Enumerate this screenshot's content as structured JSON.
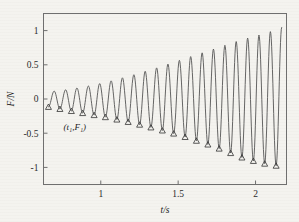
{
  "chart_data": {
    "type": "line",
    "title": "",
    "xlabel": "t/s",
    "ylabel": "F/N",
    "xlim": [
      0.63,
      2.2
    ],
    "ylim": [
      -1.25,
      1.25
    ],
    "xticks": [
      1,
      1.5,
      2
    ],
    "xtick_labels": [
      "1",
      "1.5",
      "2"
    ],
    "yticks": [
      1,
      0.5,
      0,
      -0.5,
      -1
    ],
    "ytick_labels": [
      "1",
      "0.5",
      "0",
      "-0.5",
      "-1"
    ],
    "grid": false,
    "legend": null,
    "annotations": [
      {
        "text": "(t₁,F₁)",
        "x": 0.76,
        "y": -0.45
      }
    ],
    "series": [
      {
        "name": "force-oscillation",
        "description": "damped-inverse growing sinusoid, amplitude increases with time",
        "marker": "triangle-at-troughs",
        "period": 0.0735,
        "x_start": 0.655,
        "x_end": 2.185
      }
    ],
    "trough_points": {
      "x": [
        0.662,
        0.736,
        0.81,
        0.883,
        0.957,
        1.03,
        1.104,
        1.177,
        1.251,
        1.324,
        1.398,
        1.471,
        1.545,
        1.618,
        1.692,
        1.765,
        1.839,
        1.912,
        1.986,
        2.059,
        2.133
      ],
      "y": [
        -0.115,
        -0.145,
        -0.175,
        -0.205,
        -0.235,
        -0.265,
        -0.3,
        -0.335,
        -0.375,
        -0.415,
        -0.46,
        -0.505,
        -0.555,
        -0.61,
        -0.665,
        -0.725,
        -0.79,
        -0.855,
        -0.905,
        -0.945,
        -0.975
      ]
    },
    "peak_points": {
      "x": [
        0.699,
        0.773,
        0.846,
        0.92,
        0.993,
        1.067,
        1.14,
        1.214,
        1.287,
        1.361,
        1.434,
        1.508,
        1.581,
        1.655,
        1.728,
        1.802,
        1.875,
        1.949,
        2.022,
        2.096,
        2.169
      ],
      "y": [
        0.115,
        0.135,
        0.16,
        0.19,
        0.225,
        0.265,
        0.31,
        0.355,
        0.405,
        0.455,
        0.51,
        0.565,
        0.62,
        0.675,
        0.73,
        0.785,
        0.84,
        0.89,
        0.935,
        0.985,
        1.045
      ]
    }
  },
  "axis": {
    "x_title": "t/s",
    "y_title": "F/N"
  }
}
